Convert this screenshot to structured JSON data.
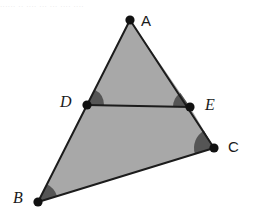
{
  "figure": {
    "canvas": {
      "width": 253,
      "height": 221,
      "background": "#ffffff"
    },
    "colors": {
      "triangle_fill": "#a8a8a8",
      "angle_arc_fill": "#555555",
      "stroke": "#1c1c1c",
      "vertex_dot": "#111111",
      "label_text": "#1a1a1a"
    },
    "top_artifact_text": "...... .. .... ... ... .... ....",
    "points": [
      {
        "id": "A",
        "label": "A",
        "x": 130,
        "y": 20,
        "label_x": 141,
        "label_y": 13,
        "style": "upright",
        "dot_r": 4.6
      },
      {
        "id": "B",
        "label": "B",
        "x": 38,
        "y": 202,
        "label_x": 13,
        "label_y": 190,
        "style": "italic",
        "dot_r": 4.6
      },
      {
        "id": "C",
        "label": "C",
        "x": 214,
        "y": 148,
        "label_x": 228,
        "label_y": 139,
        "style": "upright",
        "dot_r": 4.6
      },
      {
        "id": "D",
        "label": "D",
        "x": 87,
        "y": 105,
        "label_x": 60,
        "label_y": 94,
        "style": "italic",
        "dot_r": 4.6
      },
      {
        "id": "E",
        "label": "E",
        "x": 190,
        "y": 107,
        "label_x": 205,
        "label_y": 97,
        "style": "italic",
        "dot_r": 4.6
      }
    ],
    "polygons": {
      "triangle_abc": "130,20 38,202 214,148",
      "upper_triangle_ade": "130,20 87,105 190,107",
      "lower_quad_dbce": "87,105 38,202 214,148 190,107"
    },
    "segments": [
      {
        "name": "AB",
        "from": "A",
        "to": "B"
      },
      {
        "name": "BC",
        "from": "B",
        "to": "C"
      },
      {
        "name": "CA",
        "from": "C",
        "to": "A"
      },
      {
        "name": "DE",
        "from": "D",
        "to": "E"
      }
    ],
    "angle_marks": [
      {
        "at": "D",
        "between": [
          "A",
          "E"
        ],
        "radius": 17,
        "filled": true
      },
      {
        "at": "E",
        "between": [
          "D",
          "A"
        ],
        "radius": 17,
        "filled": true
      },
      {
        "at": "C",
        "between": [
          "E",
          "B"
        ],
        "radius": 20,
        "filled": true
      },
      {
        "at": "B",
        "between": [
          "A",
          "C"
        ],
        "radius": 20,
        "filled": true
      }
    ],
    "stroke_width": 2
  }
}
